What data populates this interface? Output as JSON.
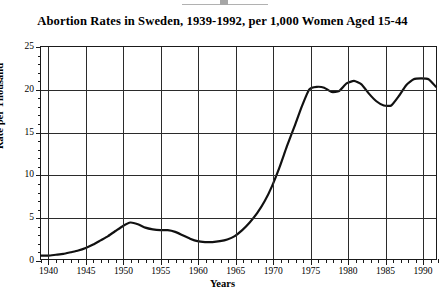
{
  "artifact": {
    "name": "scan-artifact-top"
  },
  "chart_data": {
    "type": "line",
    "title": "Abortion Rates in Sweden, 1939-1992, per 1,000 Women Aged 15-44",
    "xlabel": "Years",
    "ylabel": "Rate per Thousand",
    "xlim": [
      1939,
      1992
    ],
    "ylim": [
      0,
      25
    ],
    "grid": true,
    "legend": "none",
    "x_major_ticks": [
      1940,
      1945,
      1950,
      1955,
      1960,
      1965,
      1970,
      1975,
      1980,
      1985,
      1990
    ],
    "x_minor_tick_step": 1,
    "y_major_ticks": [
      0,
      5,
      10,
      15,
      20,
      25
    ],
    "y_minor_tick_step": 1,
    "x_tick_labels": [
      "1940",
      "1945",
      "1950",
      "1955",
      "1960",
      "1965",
      "1970",
      "1975",
      "1980",
      "1985",
      "1990"
    ],
    "y_tick_labels": [
      "0",
      "5",
      "10",
      "15",
      "20",
      "25"
    ],
    "series": [
      {
        "name": "Abortion rate per 1,000 women aged 15-44",
        "color": "#111111",
        "x": [
          1939,
          1940,
          1941,
          1942,
          1943,
          1944,
          1945,
          1946,
          1947,
          1948,
          1949,
          1950,
          1951,
          1952,
          1953,
          1954,
          1955,
          1956,
          1957,
          1958,
          1959,
          1960,
          1961,
          1962,
          1963,
          1964,
          1965,
          1966,
          1967,
          1968,
          1969,
          1970,
          1971,
          1972,
          1973,
          1974,
          1975,
          1976,
          1977,
          1978,
          1979,
          1980,
          1981,
          1982,
          1983,
          1984,
          1985,
          1986,
          1987,
          1988,
          1989,
          1990,
          1991,
          1992
        ],
        "values": [
          0.4,
          0.4,
          0.5,
          0.6,
          0.8,
          1.0,
          1.3,
          1.7,
          2.2,
          2.7,
          3.3,
          3.9,
          4.3,
          4.1,
          3.7,
          3.5,
          3.4,
          3.4,
          3.2,
          2.8,
          2.4,
          2.1,
          2.0,
          2.0,
          2.1,
          2.3,
          2.7,
          3.4,
          4.3,
          5.4,
          6.8,
          8.6,
          10.8,
          13.3,
          15.6,
          18.0,
          20.0,
          20.3,
          20.2,
          19.7,
          19.8,
          20.7,
          21.0,
          20.6,
          19.5,
          18.6,
          18.1,
          18.1,
          19.2,
          20.5,
          21.2,
          21.3,
          21.2,
          20.3
        ]
      }
    ]
  }
}
